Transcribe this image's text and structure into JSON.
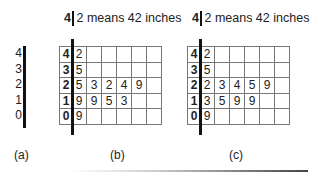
{
  "key_b": {
    "stem": "4",
    "leaf": "2",
    "text": "2 means 42 inches"
  },
  "key_c": {
    "stem": "4",
    "leaf": "2",
    "text": "2 means 42 inches"
  },
  "panel_a": {
    "label": "(a)",
    "stems": [
      "4",
      "3",
      "2",
      "1",
      "0"
    ]
  },
  "panel_b": {
    "label": "(b)",
    "rows": [
      {
        "stem": "4",
        "leaves": [
          "2",
          "",
          "",
          "",
          "",
          ""
        ]
      },
      {
        "stem": "3",
        "leaves": [
          "5",
          "",
          "",
          "",
          "",
          ""
        ]
      },
      {
        "stem": "2",
        "leaves": [
          "5",
          "3",
          "2",
          "4",
          "9",
          ""
        ]
      },
      {
        "stem": "1",
        "leaves": [
          "9",
          "9",
          "5",
          "3",
          "",
          ""
        ]
      },
      {
        "stem": "0",
        "leaves": [
          "9",
          "",
          "",
          "",
          "",
          ""
        ]
      }
    ]
  },
  "panel_c": {
    "label": "(c)",
    "rows": [
      {
        "stem": "4",
        "leaves": [
          "2",
          "",
          "",
          "",
          "",
          ""
        ]
      },
      {
        "stem": "3",
        "leaves": [
          "5",
          "",
          "",
          "",
          "",
          ""
        ]
      },
      {
        "stem": "2",
        "leaves": [
          "2",
          "3",
          "4",
          "5",
          "9",
          ""
        ]
      },
      {
        "stem": "1",
        "leaves": [
          "3",
          "5",
          "9",
          "9",
          "",
          ""
        ]
      },
      {
        "stem": "0",
        "leaves": [
          "9",
          "",
          "",
          "",
          "",
          ""
        ]
      }
    ]
  }
}
